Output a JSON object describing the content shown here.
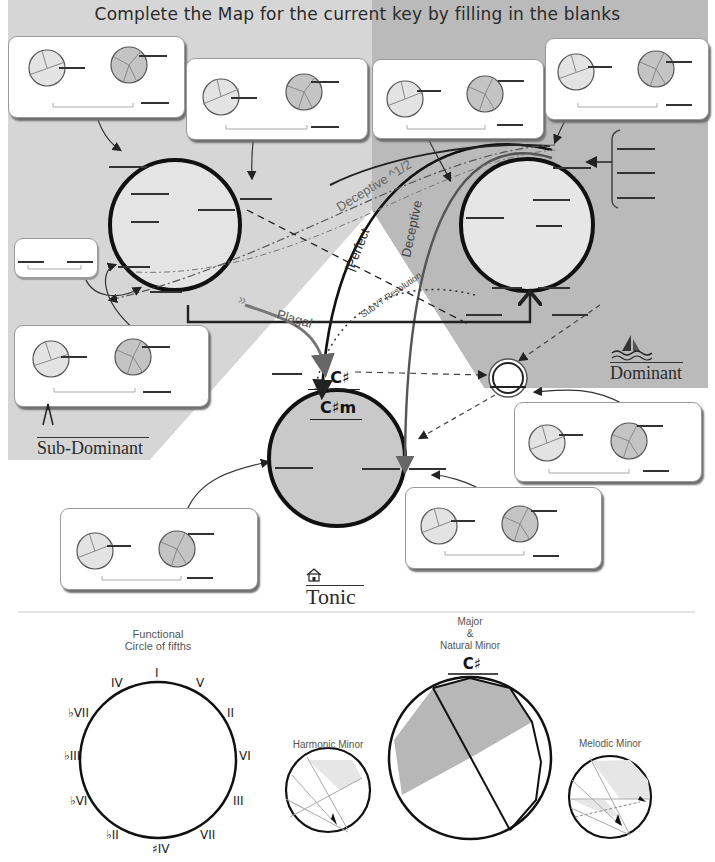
{
  "header": {
    "title": "Complete the Map for the current  key by filling in the blanks"
  },
  "regions": {
    "sub_dominant": {
      "label": "Sub-Dominant",
      "icon": "tuning-fork-icon",
      "fill": "#d4d4d4"
    },
    "dominant": {
      "label": "Dominant",
      "icon": "sailboat-icon",
      "fill": "#b9b9b9"
    },
    "tonic": {
      "label": "Tonic",
      "icon": "house-icon",
      "fill": "#ffffff"
    }
  },
  "tonic_circle": {
    "major_key": "C♯",
    "minor_key": "C♯m",
    "fill": "#c8c8c8"
  },
  "progressions": {
    "deceptive_half": "Deceptive ^1/2",
    "perfect": "Perfect",
    "deceptive": "Deceptive",
    "plagal": "Plagal",
    "subv7_resolution": "SubV7 Resolution"
  },
  "cards": [
    {
      "id": "card-subdominant-top-left"
    },
    {
      "id": "card-subdominant-top-center"
    },
    {
      "id": "card-dominant-top-center"
    },
    {
      "id": "card-dominant-top-right"
    },
    {
      "id": "card-subdominant-bottom"
    },
    {
      "id": "card-dominant-bottom"
    },
    {
      "id": "card-tonic-right"
    },
    {
      "id": "card-tonic-left"
    }
  ],
  "legend": {
    "functional_circle": {
      "title_line1": "Functional",
      "title_line2": "Circle of fifths",
      "numerals": [
        "I",
        "V",
        "II",
        "VI",
        "III",
        "VII",
        "♯IV",
        "♭II",
        "♭VI",
        "♭III",
        "♭VII",
        "IV"
      ]
    },
    "harmonic_minor": {
      "title": "Harmonic Minor"
    },
    "major_natural_minor": {
      "title_line1": "Major",
      "title_line2": "&",
      "title_line3": "Natural Minor",
      "key": "C♯"
    },
    "melodic_minor": {
      "title": "Melodic Minor"
    }
  }
}
